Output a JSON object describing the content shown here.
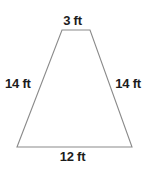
{
  "figure": {
    "shape_name": "trapezoid",
    "unit": "ft",
    "stroke_color": "#8a8a8a",
    "fill_color": "#ffffff",
    "background_color": "#ffffff",
    "label_color": "#1c1c1c",
    "vertices": {
      "top_left": [
        62,
        30
      ],
      "top_right": [
        90,
        30
      ],
      "bottom_right": [
        132,
        147
      ],
      "bottom_left": [
        17,
        147
      ]
    },
    "labels": {
      "top": "3 ft",
      "bottom": "12 ft",
      "left": "14 ft",
      "right": "14 ft"
    },
    "measurements": {
      "top_base": 3,
      "bottom_base": 12,
      "left_leg": 14,
      "right_leg": 14
    }
  }
}
